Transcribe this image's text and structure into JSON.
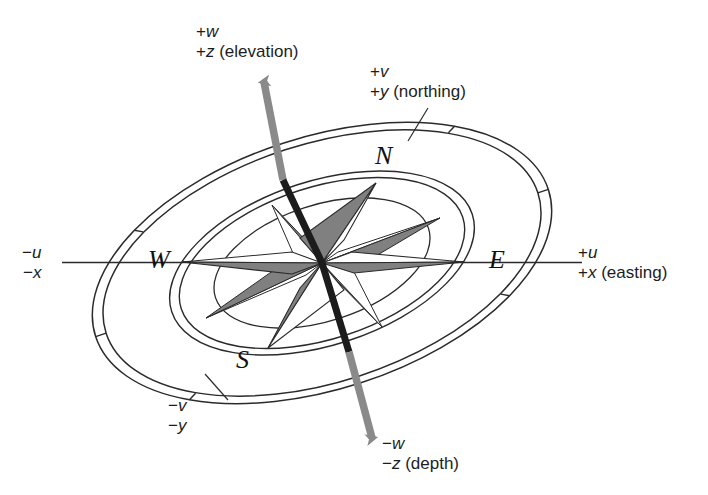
{
  "figure": {
    "type": "diagram"
  },
  "colors": {
    "ink": "#1a1a1a",
    "line": "#2b2b2b",
    "arrow_outer": "#8a8a8a",
    "arrow_inner": "#1c1c1c",
    "star_shade": "#808080",
    "star_dark": "#2a2a2a",
    "background": "#ffffff"
  },
  "axis_labels": {
    "up": {
      "line1_sign": "+",
      "line1_var": "w",
      "line2_sign": "+",
      "line2_var": "z",
      "line2_note": " (elevation)"
    },
    "north": {
      "line1_sign": "+",
      "line1_var": "v",
      "line2_sign": "+",
      "line2_var": "y",
      "line2_note": " (northing)"
    },
    "east": {
      "line1_sign": "+",
      "line1_var": "u",
      "line2_sign": "+",
      "line2_var": "x",
      "line2_note": " (easting)"
    },
    "west": {
      "line1_sign": "−",
      "line1_var": "u",
      "line2_sign": "−",
      "line2_var": "x",
      "line2_note": ""
    },
    "south": {
      "line1_sign": "−",
      "line1_var": "v",
      "line2_sign": "−",
      "line2_var": "y",
      "line2_note": ""
    },
    "down": {
      "line1_sign": "−",
      "line1_var": "w",
      "line2_sign": "−",
      "line2_var": "z",
      "line2_note": " (depth)"
    }
  },
  "cardinals": {
    "north": "N",
    "east": "E",
    "south": "S",
    "west": "W"
  },
  "geometry": {
    "center_x": 322,
    "center_y": 263,
    "ring_rotation_deg": -18,
    "outer_ring_rx": 238,
    "outer_ring_ry": 126,
    "inner_ring_rx": 158,
    "inner_ring_ry": 82,
    "core_ring_rx": 112,
    "core_ring_ry": 58
  }
}
